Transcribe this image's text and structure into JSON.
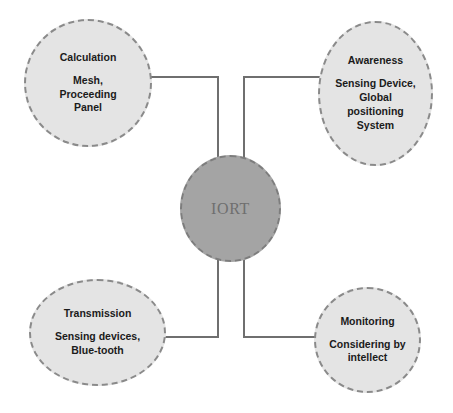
{
  "diagram": {
    "center": {
      "label": "IORT",
      "fill_color": "#a4a4a4",
      "border_color": "#7d7d7d",
      "text_color": "#6f6f6f"
    },
    "node_style": {
      "fill_color": "#e4e4e4",
      "border_color": "#8a8a8a",
      "text_color": "#1b1b1b"
    },
    "connector_color": "#6f6f6f",
    "nodes": [
      {
        "id": "calculation",
        "title": "Calculation",
        "description": "Mesh, Proceeding Panel",
        "position": "top-left"
      },
      {
        "id": "awareness",
        "title": "Awareness",
        "description": "Sensing Device, Global positioning System",
        "position": "top-right"
      },
      {
        "id": "transmission",
        "title": "Transmission",
        "description": "Sensing devices, Blue-tooth",
        "position": "bottom-left"
      },
      {
        "id": "monitoring",
        "title": "Monitoring",
        "description": "Considering by intellect",
        "position": "bottom-right"
      }
    ]
  }
}
